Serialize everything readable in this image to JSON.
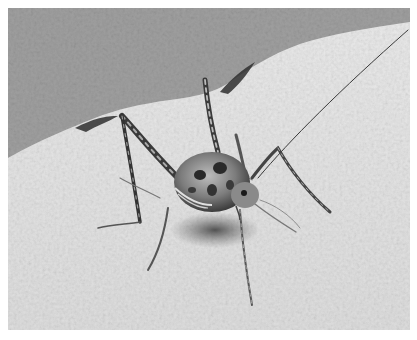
{
  "image": {
    "subject": "cave cricket on rock",
    "style": "grayscale photograph",
    "colors": {
      "border": "#ffffff",
      "background_rock": "#9a9a9a",
      "foreground_rock": "#e4e4e4",
      "insect_dark": "#2a2a2a",
      "insect_mid": "#7a7a7a",
      "shadow": "#555555"
    }
  }
}
